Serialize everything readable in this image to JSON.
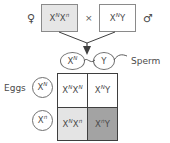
{
  "diagram": {
    "colors": {
      "mother_box_fill": "#e6e6e6",
      "father_box_fill": "#ffffff",
      "cell_white": "#ffffff",
      "cell_light": "#e4e4e4",
      "cell_dark": "#a3a3a3",
      "line": "#3f3f3f",
      "text": "#4a4a4a"
    }
  },
  "parents": {
    "mother": {
      "sex_symbol": "♀",
      "sex_name": "female",
      "allele1": "X",
      "sup1": "N",
      "allele2": "X",
      "sup2": "n",
      "genotype_plain": "XNXn"
    },
    "cross_symbol": "×",
    "father": {
      "sex_symbol": "♂",
      "sex_name": "male",
      "allele1": "X",
      "sup1": "N",
      "allele2": "Y",
      "sup2": "",
      "genotype_plain": "XNY"
    }
  },
  "gametes": {
    "sperm": {
      "label": "Sperm",
      "cells": [
        {
          "allele": "X",
          "sup": "N",
          "plain": "XN"
        },
        {
          "allele": "Y",
          "sup": "",
          "plain": "Y"
        }
      ]
    },
    "eggs": {
      "label": "Eggs",
      "cells": [
        {
          "allele": "X",
          "sup": "N",
          "plain": "XN"
        },
        {
          "allele": "X",
          "sup": "n",
          "plain": "Xn"
        }
      ]
    }
  },
  "punnett": {
    "cells": [
      {
        "id": "offspring-top-left",
        "allele1": "X",
        "sup1": "N",
        "allele2": "X",
        "sup2": "N",
        "plain": "XNXN",
        "shade": "shade-white"
      },
      {
        "id": "offspring-top-right",
        "allele1": "X",
        "sup1": "N",
        "allele2": "Y",
        "sup2": "",
        "plain": "XNY",
        "shade": "shade-white"
      },
      {
        "id": "offspring-bottom-left",
        "allele1": "X",
        "sup1": "N",
        "allele2": "X",
        "sup2": "n",
        "plain": "XNXn",
        "shade": "shade-light"
      },
      {
        "id": "offspring-bottom-right",
        "allele1": "X",
        "sup1": "n",
        "allele2": "Y",
        "sup2": "",
        "plain": "XnY",
        "shade": "shade-dark"
      }
    ]
  }
}
